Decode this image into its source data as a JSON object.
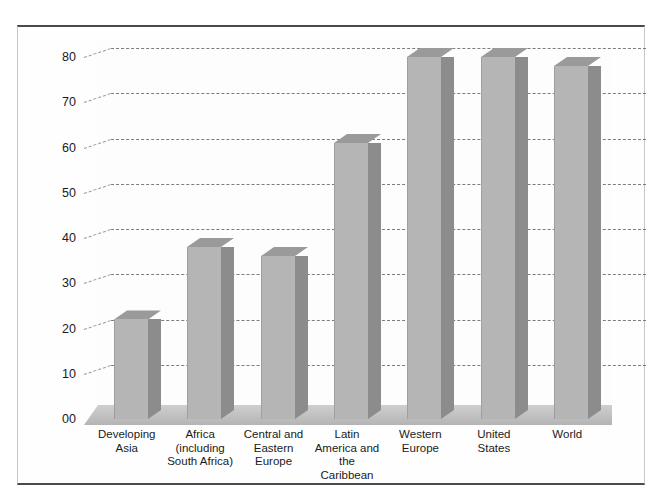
{
  "chart_data": {
    "type": "bar",
    "title": "",
    "subtitle": "",
    "xlabel": "",
    "ylabel": "",
    "ylim": [
      0,
      82
    ],
    "grid": true,
    "legend": "none",
    "style": "3d-column",
    "categories": [
      "Developing\nAsia",
      "Africa\n(including\nSouth Africa)",
      "Central and\nEastern\nEurope",
      "Latin\nAmerica and\nthe\nCaribbean",
      "Western\nEurope",
      "United\nStates",
      "World"
    ],
    "values": [
      22,
      38,
      36,
      61,
      80,
      80,
      78
    ],
    "ytick_labels": [
      "00",
      "10",
      "20",
      "30",
      "40",
      "50",
      "60",
      "70",
      "80"
    ],
    "ytick_values": [
      0,
      10,
      20,
      30,
      40,
      50,
      60,
      70,
      80
    ],
    "colors": {
      "bar_face": "#b5b5b5",
      "bar_side": "#8c8c8c",
      "bar_top": "#9a9a9a",
      "gridline": "#7d7d7d",
      "floor": "#b9b9b9",
      "frame": "#4a4a4a",
      "background": "#ffffff",
      "text": "#1b1b1b"
    }
  }
}
